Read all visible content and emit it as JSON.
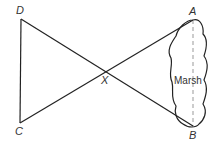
{
  "points": {
    "A": {
      "label": "A",
      "x": 193,
      "y": 20
    },
    "B": {
      "label": "B",
      "x": 193,
      "y": 126
    },
    "C": {
      "label": "C",
      "x": 20,
      "y": 123
    },
    "D": {
      "label": "D",
      "x": 21,
      "y": 19
    },
    "X": {
      "label": "X",
      "x": 111,
      "y": 72
    }
  },
  "region": {
    "label": "Marsh"
  },
  "segments": [
    "DA",
    "CB",
    "DC",
    "AB (dashed)"
  ]
}
